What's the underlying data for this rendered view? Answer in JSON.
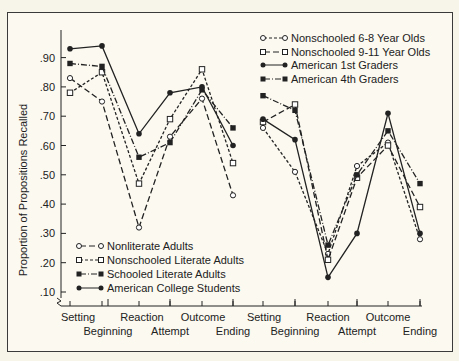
{
  "chart_data": {
    "type": "line",
    "title": "",
    "ylabel": "Proportion of Propositions Recalled",
    "xlabel": "",
    "ylim": [
      0.08,
      0.97
    ],
    "yticks": [
      ".10",
      ".20",
      ".30",
      ".40",
      ".50",
      ".60",
      ".70",
      ".80",
      ".90"
    ],
    "grid": false,
    "categories": [
      "Setting",
      "Beginning",
      "Reaction",
      "Attempt",
      "Outcome",
      "Ending",
      "Setting",
      "Beginning",
      "Reaction",
      "Attempt",
      "Outcome",
      "Ending"
    ],
    "panels": [
      {
        "name": "left",
        "legend_position": "lower-left",
        "series": [
          {
            "name": "Nonliterate Adults",
            "marker": "open-circle",
            "line": "long-dash",
            "values": [
              0.83,
              0.75,
              0.32,
              0.63,
              0.76,
              0.43
            ]
          },
          {
            "name": "Nonschooled Literate Adults",
            "marker": "open-square",
            "line": "short-dash",
            "values": [
              0.78,
              0.85,
              0.47,
              0.69,
              0.86,
              0.54
            ]
          },
          {
            "name": "Schooled Literate Adults",
            "marker": "filled-square",
            "line": "dash-dot",
            "values": [
              0.88,
              0.87,
              0.56,
              0.61,
              0.79,
              0.66
            ]
          },
          {
            "name": "American College Students",
            "marker": "filled-circle",
            "line": "solid",
            "values": [
              0.93,
              0.94,
              0.64,
              0.78,
              0.8,
              0.6
            ]
          }
        ]
      },
      {
        "name": "right",
        "legend_position": "upper-right",
        "series": [
          {
            "name": "Nonschooled 6-8 Year Olds",
            "marker": "open-circle",
            "line": "short-dash",
            "values": [
              0.66,
              0.51,
              0.23,
              0.53,
              0.61,
              0.28
            ]
          },
          {
            "name": "Nonschooled 9-11 Year Olds",
            "marker": "open-square",
            "line": "long-dash",
            "values": [
              0.68,
              0.74,
              0.21,
              0.49,
              0.6,
              0.39
            ]
          },
          {
            "name": "American 1st Graders",
            "marker": "filled-circle",
            "line": "solid",
            "values": [
              0.69,
              0.62,
              0.15,
              0.3,
              0.71,
              0.3
            ]
          },
          {
            "name": "American 4th Graders",
            "marker": "filled-square",
            "line": "dash-dot",
            "values": [
              0.77,
              0.72,
              0.26,
              0.5,
              0.65,
              0.47
            ]
          }
        ]
      }
    ]
  },
  "axis": {
    "ylabel": "Proportion of Propositions Recalled",
    "yticks": [
      ".10",
      ".20",
      ".30",
      ".40",
      ".50",
      ".60",
      ".70",
      ".80",
      ".90"
    ],
    "xlabels_top": [
      "Setting",
      "Reaction",
      "Outcome",
      "Setting",
      "Reaction",
      "Outcome"
    ],
    "xlabels_bottom": [
      "Beginning",
      "Attempt",
      "Ending",
      "Beginning",
      "Attempt",
      "Ending"
    ]
  },
  "legend_left": [
    "Nonliterate Adults",
    "Nonschooled Literate Adults",
    "Schooled Literate Adults",
    "American College Students"
  ],
  "legend_right": [
    "Nonschooled 6-8 Year Olds",
    "Nonschooled 9-11 Year Olds",
    "American 1st Graders",
    "American 4th Graders"
  ]
}
